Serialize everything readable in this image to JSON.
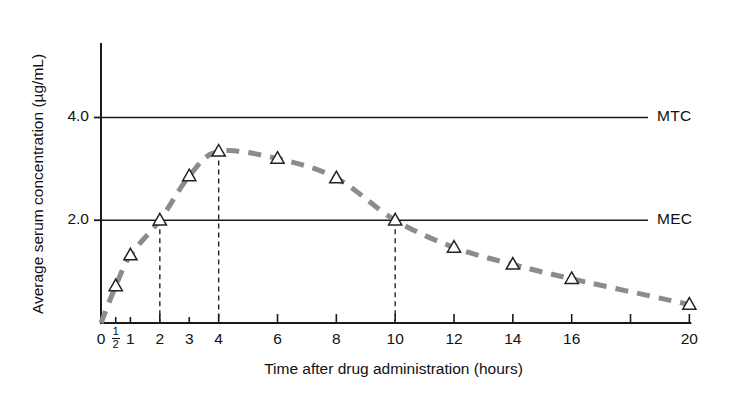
{
  "chart_data": {
    "type": "line",
    "title": "",
    "xlabel": "Time after drug administration (hours)",
    "ylabel": "Average serum concentration (µg/mL)",
    "xlim": [
      0,
      20.6
    ],
    "ylim": [
      0,
      5.45
    ],
    "grid": false,
    "legend": "none",
    "marker": "open-triangle",
    "linestyle": "dashed",
    "linecolor": "#8c8c8c",
    "markercolor": "#ffffff",
    "markeredgecolor": "#222222",
    "axiscolor": "#1a1a1a",
    "x_ticks": [
      {
        "value": 0,
        "label": "0",
        "major": true
      },
      {
        "value": 0.5,
        "label": "½",
        "major": false,
        "fraction": {
          "num": "1",
          "den": "2"
        }
      },
      {
        "value": 1,
        "label": "1",
        "major": false
      },
      {
        "value": 2,
        "label": "2",
        "major": true
      },
      {
        "value": 3,
        "label": "3",
        "major": false
      },
      {
        "value": 4,
        "label": "4",
        "major": true
      },
      {
        "value": 6,
        "label": "6",
        "major": true
      },
      {
        "value": 8,
        "label": "8",
        "major": true
      },
      {
        "value": 10,
        "label": "10",
        "major": true
      },
      {
        "value": 12,
        "label": "12",
        "major": true
      },
      {
        "value": 14,
        "label": "14",
        "major": true
      },
      {
        "value": 16,
        "label": "16",
        "major": true
      },
      {
        "value": 18,
        "label": "",
        "major": true
      },
      {
        "value": 20,
        "label": "20",
        "major": true
      }
    ],
    "y_ticks": [
      {
        "value": 2.0,
        "label": "2.0"
      },
      {
        "value": 4.0,
        "label": "4.0"
      }
    ],
    "series": [
      {
        "name": "serum concentration",
        "x": [
          0,
          0.5,
          1,
          2,
          3,
          4,
          6,
          8,
          10,
          12,
          14,
          16,
          20
        ],
        "values": [
          0.0,
          0.72,
          1.32,
          2.0,
          2.86,
          3.34,
          3.2,
          2.82,
          2.0,
          1.47,
          1.14,
          0.86,
          0.36
        ]
      }
    ],
    "threshold_lines": [
      {
        "name": "MTC",
        "label": "MTC",
        "value": 4.0,
        "description": "minimum toxic concentration"
      },
      {
        "name": "MEC",
        "label": "MEC",
        "value": 2.0,
        "description": "minimum effective concentration"
      }
    ],
    "drop_lines": [
      {
        "x": 2,
        "from": 2.0,
        "to": 0
      },
      {
        "x": 4,
        "from": 3.34,
        "to": 0
      },
      {
        "x": 10,
        "from": 2.0,
        "to": 0
      }
    ],
    "annotations": []
  }
}
